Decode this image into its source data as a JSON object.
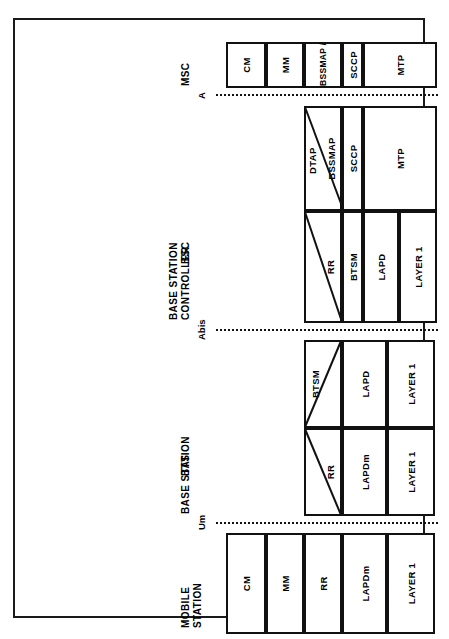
{
  "diagram": {
    "orientation": "rotated-90-ccw",
    "sections": [
      {
        "id": "mobile-station",
        "title_lines": [
          "MOBILE",
          "STATION"
        ],
        "abbrev": "",
        "rows": [
          {
            "cells": [
              {
                "label": "CM",
                "split": "none"
              },
              {
                "label": "MM",
                "split": "none"
              },
              {
                "label": "RR",
                "split": "none"
              },
              {
                "label": "LAPDm",
                "split": "none"
              },
              {
                "label": "LAYER 1",
                "split": "none"
              }
            ]
          }
        ]
      },
      {
        "id": "bts",
        "title_lines": [
          "BASE STATION"
        ],
        "abbrev": "BTS",
        "rows": [
          {
            "cells": [
              {
                "label": "RR",
                "split": "diagonal-up"
              },
              {
                "label": "LAPDm",
                "split": "none"
              },
              {
                "label": "LAYER 1",
                "split": "none"
              }
            ]
          },
          {
            "cells": [
              {
                "label": "BTSM",
                "split": "diagonal-down"
              },
              {
                "label": "LAPD",
                "split": "none"
              },
              {
                "label": "LAYER 1",
                "split": "none"
              }
            ]
          }
        ]
      },
      {
        "id": "bsc",
        "title_lines": [
          "BASE STATION",
          "CONTROLLER"
        ],
        "abbrev": "BSC",
        "rows": [
          {
            "cells": [
              {
                "label": "RR",
                "split": "diagonal-up"
              },
              {
                "label": "BTSM",
                "split": "none"
              },
              {
                "label": "LAPD",
                "split": "none"
              },
              {
                "label": "LAYER 1",
                "split": "none"
              }
            ]
          },
          {
            "cells": [
              {
                "label": "DTAP",
                "split": "diagonal-top"
              },
              {
                "label": "BSSMAP",
                "split": "none"
              },
              {
                "label": "SCCP",
                "split": "none"
              },
              {
                "label": "MTP",
                "split": "none"
              }
            ]
          }
        ]
      },
      {
        "id": "msc",
        "title_lines": [
          "MSC"
        ],
        "abbrev": "",
        "rows": [
          {
            "cells": [
              {
                "label": "CM",
                "split": "none"
              },
              {
                "label": "MM",
                "split": "none"
              },
              {
                "label": "BSSMAP / DTAP",
                "split": "none"
              },
              {
                "label": "SCCP",
                "split": "none"
              },
              {
                "label": "MTP",
                "split": "none"
              }
            ]
          }
        ]
      }
    ],
    "interfaces": [
      {
        "id": "um",
        "label": "Um"
      },
      {
        "id": "abis",
        "label": "Abis"
      },
      {
        "id": "a",
        "label": "A"
      }
    ],
    "colors": {
      "line": "#111111",
      "text": "#000000",
      "background": "#ffffff",
      "frame": "#1a1a1a"
    }
  }
}
